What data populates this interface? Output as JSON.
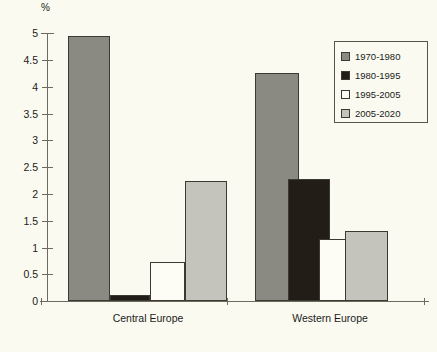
{
  "chart_data": {
    "type": "bar",
    "title": "",
    "xlabel": "",
    "ylabel": "%",
    "ylim": [
      0,
      5
    ],
    "yticks": [
      "0",
      "0.5",
      "1",
      "1.5",
      "2",
      "2.5",
      "3",
      "3.5",
      "4",
      "4.5",
      "5"
    ],
    "grid": false,
    "legend_position": "top-right",
    "categories": [
      "Central Europe",
      "Western Europe"
    ],
    "series": [
      {
        "name": "1970-1980",
        "color": "#8a8a82",
        "values": [
          4.95,
          4.25
        ]
      },
      {
        "name": "1980-1995",
        "color": "#231d18",
        "values": [
          0.11,
          2.28
        ]
      },
      {
        "name": "1995-2005",
        "color": "#fdfdf5",
        "values": [
          0.73,
          1.15
        ]
      },
      {
        "name": "2005-2020",
        "color": "#c4c4bd",
        "values": [
          2.24,
          1.3
        ]
      }
    ]
  },
  "axis": {
    "unit_label": "%",
    "y_tick_labels": [
      "5",
      "4.5",
      "4",
      "3.5",
      "3",
      "2.5",
      "2",
      "1.5",
      "1",
      "0.5",
      "0"
    ],
    "group_labels": [
      "Central Europe",
      "Western Europe"
    ]
  },
  "legend": {
    "items": [
      {
        "label": "1970-1980",
        "color": "#8a8a82"
      },
      {
        "label": "1980-1995",
        "color": "#231d18"
      },
      {
        "label": "1995-2005",
        "color": "#fdfdf5"
      },
      {
        "label": "2005-2020",
        "color": "#c4c4bd"
      }
    ]
  },
  "caption": {
    "text": ""
  }
}
